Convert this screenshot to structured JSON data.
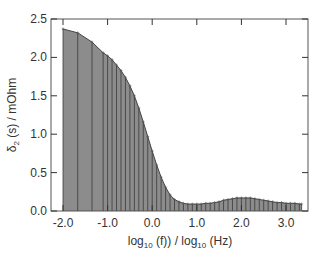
{
  "chart_data": {
    "type": "area",
    "title": "",
    "xlabel": "log10 (f)) / log10 (Hz)",
    "ylabel": "δ2 (s) / mOhm",
    "xlabel_parts": {
      "pre": "log",
      "sub1": "10",
      "mid": " (f)) / log",
      "sub2": "10",
      "post": " (Hz)"
    },
    "ylabel_parts": {
      "pre": "δ",
      "sub": "2",
      "post": " (s) / mOhm"
    },
    "xlim": [
      -2.3,
      3.5
    ],
    "ylim": [
      0.0,
      2.5
    ],
    "xticks": [
      -2.0,
      -1.0,
      0.0,
      1.0,
      2.0,
      3.0
    ],
    "xtick_labels": [
      "-2.0",
      "-1.0",
      "0.0",
      "1.0",
      "2.0",
      "3.0"
    ],
    "yticks": [
      0.0,
      0.5,
      1.0,
      1.5,
      2.0,
      2.5
    ],
    "ytick_labels": [
      "0.0",
      "0.5",
      "1.0",
      "1.5",
      "2.0",
      "2.5"
    ],
    "grid": false,
    "legend": null,
    "series": [
      {
        "name": "delta2",
        "style": "filled bars with vertical stems per data point",
        "fill_color": "#8c8c8c",
        "line_color": "#333333",
        "x": [
          -2.0,
          -1.67,
          -1.35,
          -1.1,
          -1.0,
          -0.9,
          -0.8,
          -0.7,
          -0.6,
          -0.5,
          -0.4,
          -0.3,
          -0.2,
          -0.1,
          0.0,
          0.1,
          0.2,
          0.3,
          0.4,
          0.5,
          0.6,
          0.7,
          0.8,
          0.9,
          1.0,
          1.1,
          1.2,
          1.3,
          1.4,
          1.5,
          1.6,
          1.7,
          1.8,
          1.9,
          2.0,
          2.1,
          2.2,
          2.3,
          2.4,
          2.5,
          2.6,
          2.7,
          2.8,
          2.9,
          3.0,
          3.1,
          3.2,
          3.3,
          3.35
        ],
        "values": [
          2.37,
          2.32,
          2.2,
          2.06,
          2.02,
          1.97,
          1.9,
          1.83,
          1.74,
          1.63,
          1.5,
          1.34,
          1.16,
          0.97,
          0.78,
          0.6,
          0.44,
          0.31,
          0.21,
          0.15,
          0.12,
          0.1,
          0.09,
          0.09,
          0.09,
          0.09,
          0.1,
          0.1,
          0.11,
          0.12,
          0.14,
          0.15,
          0.16,
          0.17,
          0.17,
          0.17,
          0.17,
          0.16,
          0.15,
          0.14,
          0.13,
          0.12,
          0.11,
          0.11,
          0.1,
          0.1,
          0.1,
          0.09,
          0.09
        ]
      }
    ]
  },
  "colors": {
    "frame": "#555555",
    "fill": "#8c8c8c",
    "stem": "#3a3a3a",
    "text": "#333333"
  }
}
